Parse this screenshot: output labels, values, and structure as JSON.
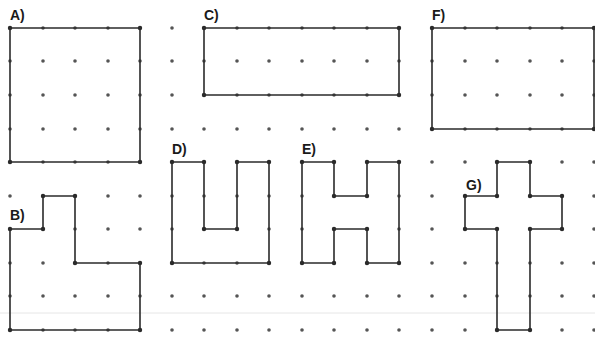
{
  "diagram": {
    "colors": {
      "background": "#ffffff",
      "dot": "#555555",
      "outline": "#2b2b2b",
      "fold_line": "#e6e6e6"
    },
    "grid": {
      "columns_x": [
        10,
        43,
        75,
        108,
        140,
        172,
        204,
        237,
        269,
        302,
        334,
        367,
        399,
        432,
        465,
        497,
        530,
        562,
        594
      ],
      "rows_y": [
        28,
        61,
        95,
        129,
        162,
        196,
        229,
        263,
        296,
        330
      ],
      "dot_radius": 1.8
    },
    "fold_line_y": 313,
    "shapes": [
      {
        "id": "A",
        "label": "A)",
        "label_pos": [
          10,
          8
        ],
        "kind": "square",
        "points": [
          [
            10,
            28
          ],
          [
            140,
            28
          ],
          [
            140,
            162
          ],
          [
            10,
            162
          ]
        ]
      },
      {
        "id": "B",
        "label": "B)",
        "label_pos": [
          10,
          208
        ],
        "kind": "l-shape",
        "points": [
          [
            43,
            196
          ],
          [
            75,
            196
          ],
          [
            75,
            263
          ],
          [
            140,
            263
          ],
          [
            140,
            330
          ],
          [
            10,
            330
          ],
          [
            10,
            229
          ],
          [
            43,
            229
          ]
        ]
      },
      {
        "id": "C",
        "label": "C)",
        "label_pos": [
          204,
          8
        ],
        "kind": "rectangle",
        "points": [
          [
            204,
            28
          ],
          [
            399,
            28
          ],
          [
            399,
            95
          ],
          [
            204,
            95
          ]
        ]
      },
      {
        "id": "D",
        "label": "D)",
        "label_pos": [
          172,
          142
        ],
        "kind": "u-shape",
        "points": [
          [
            172,
            162
          ],
          [
            204,
            162
          ],
          [
            204,
            229
          ],
          [
            237,
            229
          ],
          [
            237,
            162
          ],
          [
            269,
            162
          ],
          [
            269,
            263
          ],
          [
            172,
            263
          ]
        ]
      },
      {
        "id": "E",
        "label": "E)",
        "label_pos": [
          302,
          142
        ],
        "kind": "h-shape",
        "points": [
          [
            302,
            162
          ],
          [
            334,
            162
          ],
          [
            334,
            196
          ],
          [
            367,
            196
          ],
          [
            367,
            162
          ],
          [
            399,
            162
          ],
          [
            399,
            263
          ],
          [
            367,
            263
          ],
          [
            367,
            229
          ],
          [
            334,
            229
          ],
          [
            334,
            263
          ],
          [
            302,
            263
          ]
        ]
      },
      {
        "id": "F",
        "label": "F)",
        "label_pos": [
          432,
          8
        ],
        "kind": "rectangle",
        "points": [
          [
            432,
            28
          ],
          [
            594,
            28
          ],
          [
            594,
            129
          ],
          [
            432,
            129
          ]
        ]
      },
      {
        "id": "G",
        "label": "G)",
        "label_pos": [
          466,
          178
        ],
        "kind": "cross",
        "points": [
          [
            497,
            162
          ],
          [
            530,
            162
          ],
          [
            530,
            196
          ],
          [
            562,
            196
          ],
          [
            562,
            229
          ],
          [
            530,
            229
          ],
          [
            530,
            330
          ],
          [
            497,
            330
          ],
          [
            497,
            229
          ],
          [
            465,
            229
          ],
          [
            465,
            196
          ],
          [
            497,
            196
          ]
        ]
      }
    ]
  }
}
